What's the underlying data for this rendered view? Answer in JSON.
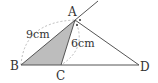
{
  "diagram": {
    "points": {
      "A": {
        "label": "A",
        "x": 75,
        "y": 20
      },
      "B": {
        "label": "B",
        "x": 21,
        "y": 65
      },
      "C": {
        "label": "C",
        "x": 61,
        "y": 65
      },
      "D": {
        "label": "D",
        "x": 139,
        "y": 65
      }
    },
    "lengths": {
      "BA": "9cm",
      "AC": "6cm"
    },
    "colors": {
      "line": "#555555",
      "shade": "#bdbdbd",
      "dashed": "#aaaaaa"
    }
  }
}
